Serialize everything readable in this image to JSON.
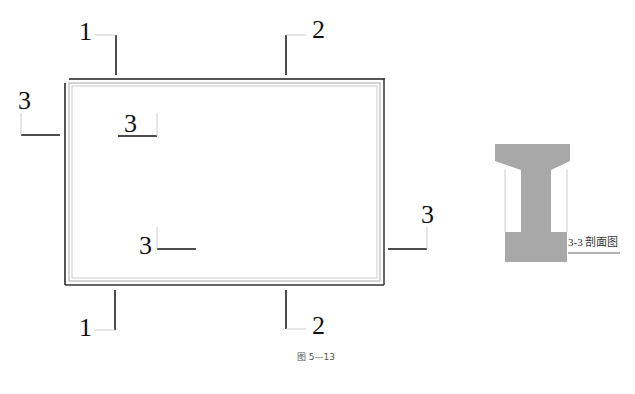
{
  "diagram": {
    "type": "engineering-plan",
    "caption": "图 5—13",
    "section_markers": {
      "top_left": "1",
      "bottom_left": "1",
      "top_right": "2",
      "bottom_right": "2",
      "left_outer": "3",
      "inner_top": "3",
      "inner_bottom": "3",
      "right_outer": "3"
    },
    "section_view": {
      "title": "3-3 剖面图",
      "fill_color": "#a8a8a8"
    }
  }
}
